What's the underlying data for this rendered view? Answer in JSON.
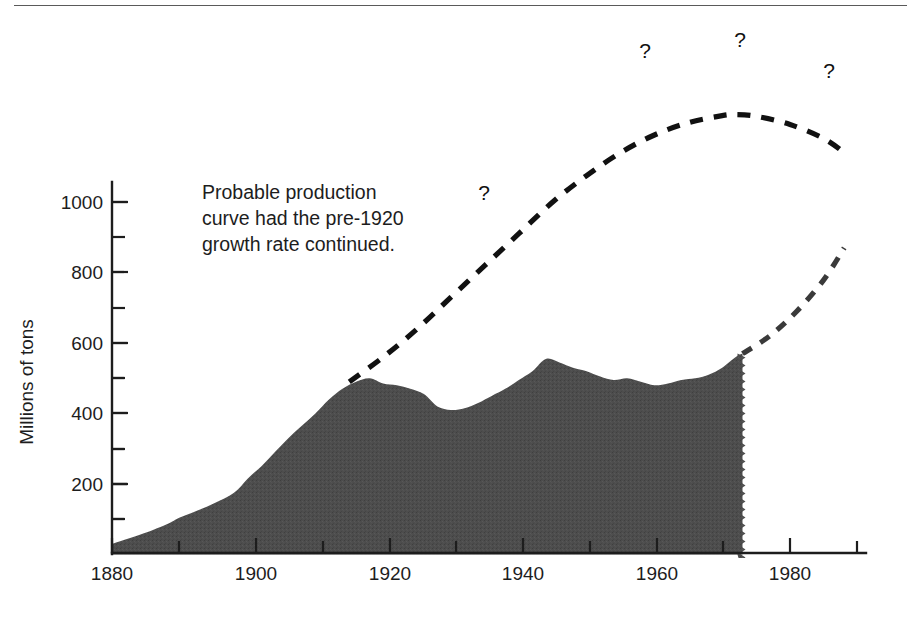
{
  "figure": {
    "kind": "statistical-figure",
    "background_color": "#ffffff",
    "has_top_rule": true
  },
  "annotation": {
    "lines": [
      "Probable production",
      "curve had the pre-1920",
      "growth rate continued."
    ],
    "full_text": "Probable production curve had the pre-1920 growth rate continued."
  },
  "question_marks": {
    "glyph": "?",
    "count": 4,
    "positions": [
      {
        "x": 484,
        "y": 200
      },
      {
        "x": 645,
        "y": 58
      },
      {
        "x": 740,
        "y": 47
      },
      {
        "x": 829,
        "y": 78
      }
    ]
  },
  "chart_data": {
    "type": "area",
    "title": "",
    "subtitle": "",
    "xlabel": "",
    "ylabel": "Millions of tons",
    "xlim": [
      1880,
      1991
    ],
    "ylim": [
      0,
      1100
    ],
    "grid": false,
    "legend": "none",
    "x_ticks_major": [
      1880,
      1900,
      1920,
      1940,
      1960,
      1980
    ],
    "x_tick_labels": [
      "1880",
      "1900",
      "1920",
      "1940",
      "1960",
      "1980"
    ],
    "x_ticks_minor": [
      1890,
      1910,
      1930,
      1950,
      1970,
      1990
    ],
    "y_ticks_major": [
      200,
      400,
      600,
      800,
      1000
    ],
    "y_tick_labels": [
      "200",
      "400",
      "600",
      "800",
      "1000"
    ],
    "y_ticks_minor": [
      100,
      300,
      500,
      700,
      900
    ],
    "series": [
      {
        "name": "Actual production",
        "style": "filled-area",
        "color": "#4a4a4a",
        "x": [
          1880,
          1884,
          1888,
          1890,
          1892,
          1895,
          1898,
          1900,
          1902,
          1904,
          1906,
          1908,
          1910,
          1912,
          1914,
          1916,
          1918,
          1920,
          1922,
          1924,
          1926,
          1928,
          1930,
          1932,
          1934,
          1936,
          1938,
          1940,
          1942,
          1944,
          1946,
          1948,
          1950,
          1952,
          1954,
          1956,
          1958,
          1960,
          1962,
          1964,
          1966,
          1968,
          1970,
          1972,
          1973
        ],
        "y": [
          30,
          55,
          85,
          105,
          120,
          145,
          175,
          215,
          250,
          290,
          330,
          365,
          400,
          440,
          470,
          490,
          500,
          485,
          480,
          470,
          455,
          420,
          410,
          415,
          430,
          450,
          470,
          495,
          520,
          555,
          545,
          530,
          520,
          505,
          495,
          500,
          490,
          480,
          485,
          495,
          500,
          510,
          530,
          560,
          570
        ],
        "units": "millions of tons",
        "end_year": 1973,
        "end_value": 570,
        "peak_value": 560,
        "peak_year": 1944
      },
      {
        "name": "Probable production curve (pre-1920 growth rate continued)",
        "style": "dashed-black",
        "color": "#111111",
        "x": [
          1915,
          1920,
          1925,
          1930,
          1935,
          1940,
          1945,
          1950,
          1955,
          1960,
          1965,
          1970,
          1972,
          1975,
          1980,
          1985,
          1988
        ],
        "y": [
          490,
          560,
          640,
          730,
          820,
          910,
          1000,
          1075,
          1140,
          1190,
          1225,
          1245,
          1248,
          1243,
          1220,
          1180,
          1140
        ]
      },
      {
        "name": "Projected future production",
        "style": "dashed-gray",
        "color": "#3a3a3a",
        "x": [
          1973,
          1977,
          1981,
          1985,
          1988
        ],
        "y": [
          570,
          620,
          690,
          780,
          870
        ]
      }
    ]
  }
}
